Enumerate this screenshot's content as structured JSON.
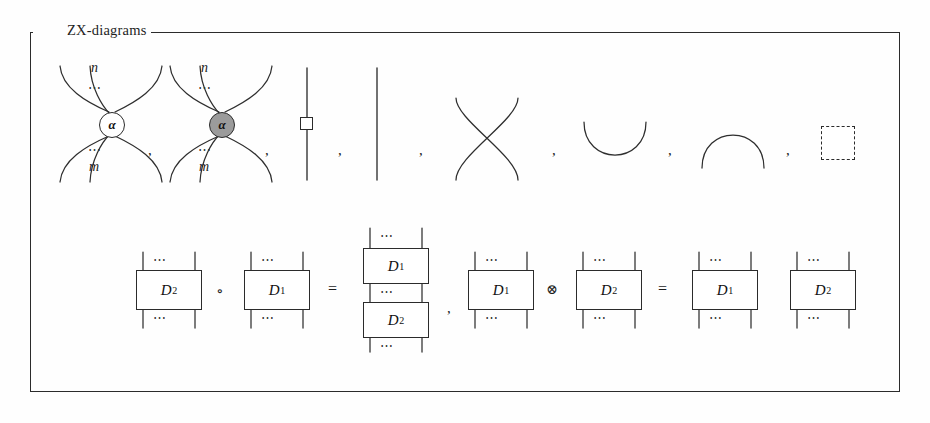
{
  "figure": {
    "title": "ZX-diagrams",
    "border_color": "#2b2b2b",
    "background": "#fefefe"
  },
  "generators": {
    "row_label": "generators",
    "items": [
      {
        "name": "white-spider",
        "node_label": "α",
        "top_label": "n",
        "bottom_label": "m",
        "ellipsis": "⋯",
        "fill": "#ffffff",
        "legs_in": 3,
        "legs_out": 3
      },
      {
        "name": "gray-spider",
        "node_label": "α",
        "top_label": "n",
        "bottom_label": "m",
        "ellipsis": "⋯",
        "fill": "#9b9b9b",
        "legs_in": 3,
        "legs_out": 3
      },
      {
        "name": "hadamard-box",
        "node_label": "",
        "fill": "#ffffff"
      },
      {
        "name": "identity-wire",
        "node_label": ""
      },
      {
        "name": "swap-crossing",
        "node_label": ""
      },
      {
        "name": "cup",
        "node_label": ""
      },
      {
        "name": "cap",
        "node_label": ""
      },
      {
        "name": "empty-diagram",
        "node_label": "",
        "style": "dashed"
      }
    ],
    "separator": ","
  },
  "equations": {
    "composition": {
      "left_box_a": "D",
      "left_box_a_sub": "2",
      "operator": "∘",
      "left_box_b": "D",
      "left_box_b_sub": "1",
      "equals": "=",
      "result_top": "D",
      "result_top_sub": "1",
      "result_bottom": "D",
      "result_bottom_sub": "2",
      "ellipsis": "⋯"
    },
    "tensor": {
      "left_box_a": "D",
      "left_box_a_sub": "1",
      "operator": "⊗",
      "left_box_b": "D",
      "left_box_b_sub": "2",
      "equals": "=",
      "result_left": "D",
      "result_left_sub": "1",
      "result_right": "D",
      "result_right_sub": "2",
      "ellipsis": "⋯"
    },
    "separator": ","
  }
}
